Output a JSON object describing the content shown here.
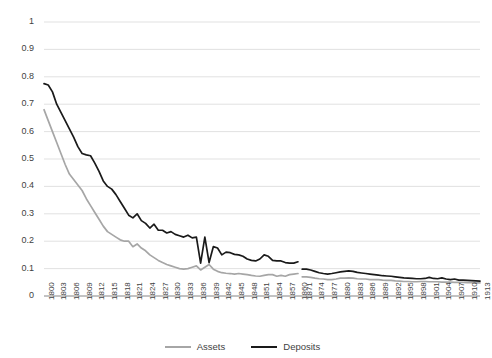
{
  "chart_data": {
    "type": "line",
    "title": "",
    "subtitle": "",
    "xlabel": "",
    "ylabel": "",
    "ylim": [
      0,
      1
    ],
    "ytick_labels": [
      "1",
      "0.9",
      "0.8",
      "0.7",
      "0.6",
      "0.5",
      "0.4",
      "0.3",
      "0.2",
      "0.1",
      "0"
    ],
    "ytick_values": [
      1,
      0.9,
      0.8,
      0.7,
      0.6,
      0.5,
      0.4,
      0.3,
      0.2,
      0.1,
      0
    ],
    "grid": "horizontal",
    "legend_position": "bottom-center",
    "xtick_labels": [
      "1800",
      "1803",
      "1806",
      "1809",
      "1812",
      "1815",
      "1818",
      "1821",
      "1824",
      "1827",
      "1830",
      "1833",
      "1836",
      "1839",
      "1842",
      "1845",
      "1848",
      "1851",
      "1854",
      "1857",
      "1860",
      "1871",
      "1874",
      "1877",
      "1880",
      "1883",
      "1886",
      "1889",
      "1892",
      "1895",
      "1898",
      "1901",
      "1904",
      "1907",
      "1910",
      "1913"
    ],
    "x": [
      1800,
      1801,
      1802,
      1803,
      1804,
      1805,
      1806,
      1807,
      1808,
      1809,
      1810,
      1811,
      1812,
      1813,
      1814,
      1815,
      1816,
      1817,
      1818,
      1819,
      1820,
      1821,
      1822,
      1823,
      1824,
      1825,
      1826,
      1827,
      1828,
      1829,
      1830,
      1831,
      1832,
      1833,
      1834,
      1835,
      1836,
      1837,
      1838,
      1839,
      1840,
      1841,
      1842,
      1843,
      1844,
      1845,
      1846,
      1847,
      1848,
      1849,
      1850,
      1851,
      1852,
      1853,
      1854,
      1855,
      1856,
      1857,
      1858,
      1859,
      1860,
      1871,
      1872,
      1873,
      1874,
      1875,
      1876,
      1877,
      1878,
      1879,
      1880,
      1881,
      1882,
      1883,
      1884,
      1885,
      1886,
      1887,
      1888,
      1889,
      1890,
      1891,
      1892,
      1893,
      1894,
      1895,
      1896,
      1897,
      1898,
      1899,
      1900,
      1901,
      1902,
      1903,
      1904,
      1905,
      1906,
      1907,
      1908,
      1909,
      1910,
      1911,
      1912,
      1913
    ],
    "gap_after": 1860,
    "gap_before": 1871,
    "series": [
      {
        "name": "Assets",
        "color": "#a6a6a6",
        "values": [
          0.68,
          0.64,
          0.6,
          0.56,
          0.52,
          0.48,
          0.445,
          0.425,
          0.405,
          0.385,
          0.355,
          0.33,
          0.305,
          0.28,
          0.255,
          0.235,
          0.225,
          0.215,
          0.205,
          0.2,
          0.2,
          0.18,
          0.19,
          0.175,
          0.165,
          0.15,
          0.14,
          0.13,
          0.122,
          0.115,
          0.11,
          0.105,
          0.1,
          0.098,
          0.1,
          0.105,
          0.11,
          0.095,
          0.105,
          0.115,
          0.098,
          0.09,
          0.085,
          0.083,
          0.082,
          0.08,
          0.082,
          0.08,
          0.078,
          0.075,
          0.073,
          0.072,
          0.075,
          0.078,
          0.078,
          0.072,
          0.075,
          0.072,
          0.078,
          0.08,
          0.082,
          0.07,
          0.07,
          0.068,
          0.065,
          0.063,
          0.062,
          0.06,
          0.06,
          0.062,
          0.065,
          0.065,
          0.066,
          0.065,
          0.063,
          0.062,
          0.062,
          0.06,
          0.06,
          0.06,
          0.058,
          0.057,
          0.057,
          0.055,
          0.054,
          0.053,
          0.053,
          0.052,
          0.052,
          0.053,
          0.053,
          0.052,
          0.052,
          0.052,
          0.051,
          0.051,
          0.051,
          0.05,
          0.05,
          0.05,
          0.049,
          0.049,
          0.048,
          0.048
        ],
        "start_value": 0.68,
        "end_value": 0.048
      },
      {
        "name": "Deposits",
        "color": "#1a1a1a",
        "values": [
          0.775,
          0.77,
          0.745,
          0.7,
          0.67,
          0.64,
          0.61,
          0.58,
          0.545,
          0.52,
          0.515,
          0.512,
          0.485,
          0.455,
          0.42,
          0.4,
          0.39,
          0.37,
          0.345,
          0.32,
          0.295,
          0.285,
          0.3,
          0.275,
          0.265,
          0.248,
          0.262,
          0.24,
          0.24,
          0.23,
          0.235,
          0.225,
          0.22,
          0.215,
          0.222,
          0.212,
          0.215,
          0.12,
          0.215,
          0.122,
          0.18,
          0.175,
          0.15,
          0.16,
          0.158,
          0.152,
          0.15,
          0.145,
          0.135,
          0.13,
          0.128,
          0.135,
          0.15,
          0.145,
          0.13,
          0.128,
          0.128,
          0.122,
          0.12,
          0.12,
          0.125,
          0.098,
          0.098,
          0.095,
          0.09,
          0.085,
          0.082,
          0.08,
          0.082,
          0.085,
          0.088,
          0.09,
          0.092,
          0.09,
          0.086,
          0.084,
          0.082,
          0.08,
          0.078,
          0.076,
          0.074,
          0.073,
          0.072,
          0.07,
          0.068,
          0.066,
          0.065,
          0.064,
          0.063,
          0.063,
          0.064,
          0.068,
          0.064,
          0.063,
          0.066,
          0.062,
          0.06,
          0.062,
          0.058,
          0.058,
          0.057,
          0.056,
          0.055,
          0.054
        ],
        "start_value": 0.775,
        "end_value": 0.054
      }
    ]
  },
  "legend": {
    "items": [
      {
        "label": "Assets",
        "color": "#a6a6a6"
      },
      {
        "label": "Deposits",
        "color": "#1a1a1a"
      }
    ]
  },
  "colors": {
    "assets": "#a6a6a6",
    "deposits": "#1a1a1a",
    "gridline": "#d9d9d9",
    "axis": "#868686",
    "text": "#3f3f3f",
    "background": "#ffffff"
  }
}
